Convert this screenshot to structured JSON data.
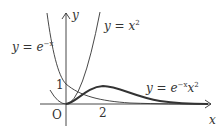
{
  "diagram": {
    "type": "function-graph",
    "axes": {
      "x_label": "x",
      "y_label": "y",
      "origin_label": "O",
      "x_ticks": [
        {
          "value": 2,
          "label": "2"
        }
      ],
      "y_ticks": [
        {
          "value": 1,
          "label": "1"
        }
      ]
    },
    "curves": [
      {
        "name": "exp-neg-x",
        "label_prefix": "y = e",
        "label_sup": "−x",
        "label_rest": "",
        "style": "thin"
      },
      {
        "name": "x-squared",
        "label_prefix": "y = x",
        "label_sup": "2",
        "label_rest": "",
        "style": "thin"
      },
      {
        "name": "exp-neg-x-times-x-squared",
        "label_prefix": "y = e",
        "label_sup": "−x",
        "label_rest": "x",
        "label_sup2": "2",
        "style": "thick"
      }
    ],
    "colors": {
      "axis": "#333333",
      "curve": "#333333",
      "text": "#333333"
    }
  }
}
